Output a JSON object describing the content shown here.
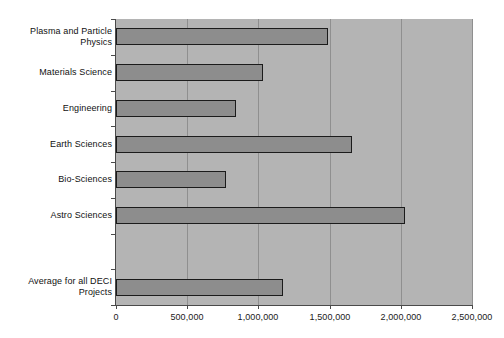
{
  "chart_data": {
    "type": "bar",
    "orientation": "horizontal",
    "title": "",
    "subtitle": "",
    "xlabel": "",
    "ylabel": "",
    "grid": true,
    "legend": false,
    "xlim": [
      0,
      2500000
    ],
    "xticks": [
      0,
      500000,
      1000000,
      1500000,
      2000000,
      2500000
    ],
    "xtick_labels": [
      "0",
      "500,000",
      "1,000,000",
      "1,500,000",
      "2,000,000",
      "2,500,000"
    ],
    "categories": [
      "Plasma and Particle\nPhysics",
      "Materials Science",
      "Engineering",
      "Earth Sciences",
      "Bio-Sciences",
      "Astro Sciences",
      "",
      "Average for all DECI\nProjects"
    ],
    "values": [
      1490000,
      1030000,
      845000,
      1660000,
      775000,
      2030000,
      null,
      1170000
    ],
    "series": [
      {
        "name": "Allocation",
        "values": [
          1490000,
          1030000,
          845000,
          1660000,
          775000,
          2030000,
          null,
          1170000
        ]
      }
    ],
    "bar_color": "#8d8d8d",
    "bar_edge_color": "#1b1b1b",
    "plot_background": "#b4b4b4",
    "grid_color": "#8f8f8f",
    "axis_color": "#4a4a4a",
    "page_background": "#ffffff"
  }
}
